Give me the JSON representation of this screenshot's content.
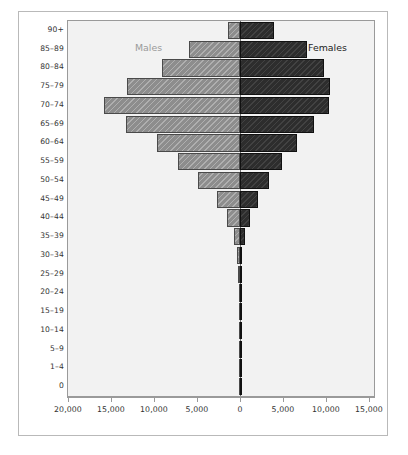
{
  "chart_data": {
    "type": "bar",
    "subtype": "population-pyramid",
    "title": "",
    "xlabel": "",
    "ylabel": "",
    "orientation": "horizontal",
    "grid": false,
    "legend_position": "inside-plot",
    "categories": [
      "90+",
      "85–89",
      "80–84",
      "75–79",
      "70–74",
      "65–69",
      "60–64",
      "55–59",
      "50–54",
      "45–49",
      "40–44",
      "35–39",
      "30–34",
      "25–29",
      "20–24",
      "15–19",
      "10–14",
      "5–9",
      "1–4",
      "0"
    ],
    "xlim": [
      -20000,
      15000
    ],
    "xticks": [
      20000,
      15000,
      10000,
      5000,
      0,
      5000,
      10000,
      15000
    ],
    "xticklabels": [
      "20,000",
      "15,000",
      "10,000",
      "5,000",
      "0",
      "5,000",
      "10,000",
      "15,000"
    ],
    "series": [
      {
        "name": "Males",
        "side": "left",
        "color": "#8d8d8d",
        "values": [
          1400,
          5900,
          9100,
          13100,
          15800,
          13200,
          9600,
          7200,
          4900,
          2700,
          1500,
          700,
          320,
          180,
          120,
          90,
          70,
          55,
          40,
          30
        ]
      },
      {
        "name": "Females",
        "side": "right",
        "color": "#2d2d2d",
        "values": [
          4000,
          7800,
          9800,
          10500,
          10400,
          8600,
          6600,
          4900,
          3400,
          2100,
          1200,
          600,
          280,
          160,
          110,
          80,
          60,
          48,
          35,
          25
        ]
      }
    ]
  },
  "annotations": {
    "males_label": "Males",
    "females_label": "Females"
  }
}
